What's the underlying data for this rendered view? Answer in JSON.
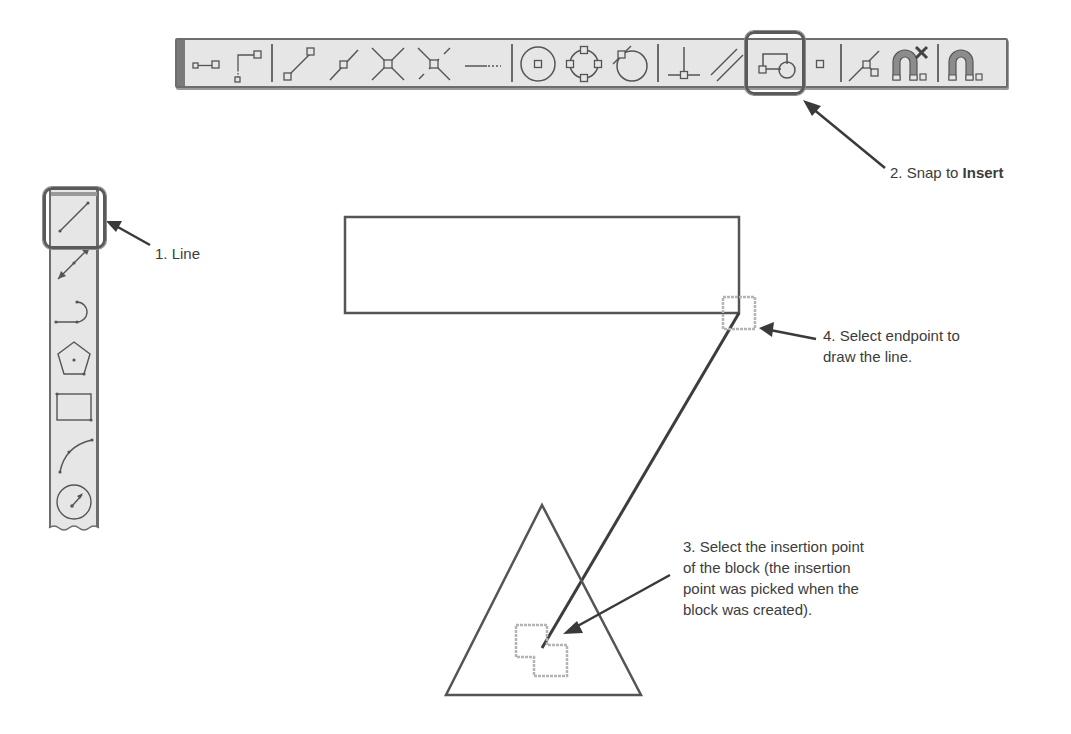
{
  "horizontal_toolbar": {
    "name": "Object Snap toolbar",
    "buttons": [
      {
        "id": "temporary-track-point",
        "icon": "temporary-track-point-icon"
      },
      {
        "id": "snap-from",
        "icon": "snap-from-icon"
      },
      {
        "id": "snap-to-endpoint",
        "icon": "endpoint-icon"
      },
      {
        "id": "snap-to-midpoint",
        "icon": "midpoint-icon"
      },
      {
        "id": "snap-to-intersection",
        "icon": "intersection-icon"
      },
      {
        "id": "snap-to-apparent-intersection",
        "icon": "apparent-intersection-icon"
      },
      {
        "id": "snap-to-extension",
        "icon": "extension-icon"
      },
      {
        "id": "snap-to-center",
        "icon": "center-icon"
      },
      {
        "id": "snap-to-quadrant",
        "icon": "quadrant-icon"
      },
      {
        "id": "snap-to-tangent",
        "icon": "tangent-icon"
      },
      {
        "id": "snap-to-perpendicular",
        "icon": "perpendicular-icon"
      },
      {
        "id": "snap-to-parallel",
        "icon": "parallel-icon"
      },
      {
        "id": "snap-to-insert",
        "icon": "insert-icon",
        "highlighted": true
      },
      {
        "id": "snap-to-node",
        "icon": "node-icon"
      },
      {
        "id": "snap-to-nearest",
        "icon": "nearest-icon"
      },
      {
        "id": "snap-to-none",
        "icon": "snap-none-icon"
      },
      {
        "id": "osnap-settings",
        "icon": "osnap-settings-icon"
      }
    ]
  },
  "vertical_toolbar": {
    "name": "Draw toolbar",
    "buttons": [
      {
        "id": "line",
        "icon": "line-icon",
        "highlighted": true
      },
      {
        "id": "construction-line",
        "icon": "construction-line-icon"
      },
      {
        "id": "polyline",
        "icon": "polyline-icon"
      },
      {
        "id": "polygon",
        "icon": "polygon-icon"
      },
      {
        "id": "rectangle",
        "icon": "rectangle-icon"
      },
      {
        "id": "arc",
        "icon": "arc-icon"
      },
      {
        "id": "circle",
        "icon": "circle-icon"
      }
    ]
  },
  "callouts": {
    "step1": "1. Line",
    "step2_prefix": "2. Snap to ",
    "step2_bold": "Insert",
    "step3_lines": [
      "3. Select the insertion point",
      "of the block (the insertion",
      "point was picked when the",
      "block was created)."
    ],
    "step4_lines": [
      "4. Select endpoint to",
      "draw the line."
    ]
  },
  "colors": {
    "toolbar_bg": "#e6e6e6",
    "toolbar_border": "#6d6d6d",
    "icon_stroke": "#555555",
    "geometry_stroke": "#555555",
    "snap_marker": "#b4b4b4",
    "arrow": "#3a3a3a",
    "magnet_fill": "#8c8c8c"
  }
}
